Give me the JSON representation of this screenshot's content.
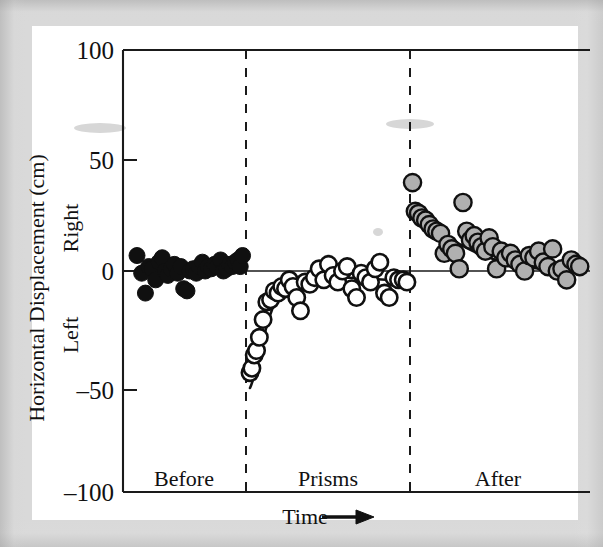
{
  "figure": {
    "background_color": "#ffffff",
    "surround_color": "#d9d9d9",
    "ink_color": "#111111"
  },
  "labels": {
    "y_axis_title": "Horizontal Displacement (cm)",
    "y_positive_direction": "Right",
    "y_negative_direction": "Left",
    "x_axis_title": "Time",
    "x_axis_arrow": "arrow-right-icon",
    "phase_before": "Before",
    "phase_prisms": "Prisms",
    "phase_after": "After",
    "tick_100": "100",
    "tick_50": "50",
    "tick_0": "0",
    "tick_neg50": "–50",
    "tick_neg100": "–100"
  },
  "chart_data": {
    "type": "scatter",
    "title": "",
    "xlabel": "Time",
    "ylabel": "Horizontal Displacement (cm)",
    "ylim": [
      -100,
      100
    ],
    "yticks": [
      -100,
      -50,
      0,
      50,
      100
    ],
    "ytick_labels": [
      "–100",
      "–50",
      "0",
      "50",
      "100"
    ],
    "grid": false,
    "legend_position": "none",
    "x_is_categorical_time": true,
    "annotations": [
      {
        "text": "Before",
        "x": 0.13,
        "y": -88
      },
      {
        "text": "Prisms",
        "x": 0.47,
        "y": -88
      },
      {
        "text": "After",
        "x": 0.8,
        "y": -88
      }
    ],
    "phase_dividers_x": [
      0.265,
      0.615
    ],
    "zero_reference_line": 0,
    "series": [
      {
        "name": "Before",
        "marker": "filled-black-circle",
        "color": "#101010",
        "x": [
          0.03,
          0.04,
          0.048,
          0.055,
          0.062,
          0.07,
          0.077,
          0.084,
          0.09,
          0.096,
          0.103,
          0.11,
          0.117,
          0.124,
          0.13,
          0.137,
          0.143,
          0.15,
          0.157,
          0.163,
          0.17,
          0.176,
          0.182,
          0.189,
          0.196,
          0.202,
          0.209,
          0.215,
          0.222,
          0.228,
          0.234,
          0.24,
          0.246,
          0.251,
          0.256
        ],
        "y": [
          7,
          -1,
          -10,
          2,
          1,
          -4,
          4,
          6,
          0,
          -2,
          1,
          3,
          -1,
          2,
          -8,
          -9,
          0,
          1,
          -1,
          2,
          4,
          0,
          2,
          1,
          3,
          2,
          5,
          0,
          1,
          3,
          2,
          4,
          5,
          2,
          7
        ]
      },
      {
        "name": "Prisms",
        "marker": "open-white-circle",
        "color": "#ffffff",
        "x": [
          0.272,
          0.276,
          0.281,
          0.286,
          0.292,
          0.3,
          0.308,
          0.316,
          0.324,
          0.332,
          0.34,
          0.348,
          0.356,
          0.364,
          0.372,
          0.38,
          0.39,
          0.4,
          0.41,
          0.42,
          0.43,
          0.44,
          0.45,
          0.46,
          0.47,
          0.48,
          0.49,
          0.5,
          0.51,
          0.52,
          0.53,
          0.54,
          0.55,
          0.56,
          0.57,
          0.58,
          0.59,
          0.6,
          0.608
        ],
        "y": [
          -46,
          -44,
          -38,
          -36,
          -30,
          -22,
          -14,
          -13,
          -9,
          -10,
          -7,
          -8,
          -4,
          -7,
          -12,
          -18,
          -5,
          -6,
          -3,
          1,
          -4,
          3,
          -2,
          -5,
          0,
          2,
          -8,
          -12,
          -1,
          -3,
          -5,
          1,
          4,
          -10,
          -12,
          -3,
          -4,
          -4,
          -5
        ]
      },
      {
        "name": "After",
        "marker": "gray-filled-circle",
        "color": "#b0b0b0",
        "x": [
          0.62,
          0.626,
          0.633,
          0.64,
          0.648,
          0.656,
          0.664,
          0.672,
          0.68,
          0.688,
          0.696,
          0.704,
          0.712,
          0.72,
          0.728,
          0.736,
          0.744,
          0.752,
          0.76,
          0.768,
          0.776,
          0.784,
          0.792,
          0.8,
          0.81,
          0.82,
          0.83,
          0.84,
          0.85,
          0.86,
          0.87,
          0.88,
          0.89,
          0.9,
          0.91,
          0.92,
          0.93,
          0.94,
          0.95,
          0.96,
          0.97,
          0.978
        ],
        "y": [
          40,
          27,
          26,
          24,
          23,
          21,
          19,
          18,
          17,
          8,
          12,
          10,
          8,
          1,
          31,
          18,
          14,
          16,
          13,
          11,
          9,
          15,
          11,
          1,
          9,
          6,
          8,
          5,
          3,
          0,
          7,
          6,
          9,
          4,
          2,
          10,
          0,
          1,
          -4,
          5,
          3,
          2
        ]
      }
    ],
    "fit_curves": [
      {
        "name": "Prisms adaptation fit",
        "phase": "Prisms",
        "model": "exponential-recovery",
        "start_y": -47,
        "asymptote_y": -4
      },
      {
        "name": "After-effect decay fit",
        "phase": "After",
        "model": "exponential-decay",
        "start_y": 28,
        "asymptote_y": 3
      }
    ]
  }
}
